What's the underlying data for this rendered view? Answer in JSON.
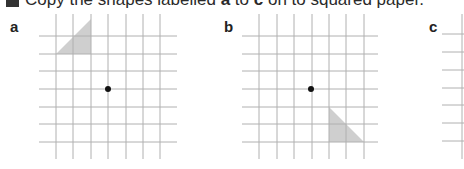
{
  "question": {
    "number_box": "",
    "text_before": "Copy the shapes labelled ",
    "first_label": "a",
    "text_middle": " to ",
    "last_label": "c",
    "text_after": " on to squared paper."
  },
  "figures": [
    {
      "label": "a",
      "grid": {
        "columns_x": [
          56,
          73,
          91,
          108,
          126,
          143,
          160
        ],
        "rows_y": [
          36,
          54,
          71,
          89,
          107,
          124,
          142
        ],
        "vertical_span": [
          14,
          159
        ],
        "horizontal_span": [
          39,
          177
        ]
      },
      "centre_dot": {
        "x": 108,
        "y": 89
      },
      "shape": {
        "type": "right-triangle",
        "points": [
          [
            56,
            54
          ],
          [
            91,
            54
          ],
          [
            91,
            19
          ]
        ]
      }
    },
    {
      "label": "b",
      "grid": {
        "columns_x": [
          259,
          277,
          294,
          312,
          329,
          346,
          364
        ],
        "rows_y": [
          36,
          54,
          71,
          89,
          107,
          124,
          142
        ],
        "vertical_span": [
          14,
          159
        ],
        "horizontal_span": [
          242,
          378
        ]
      },
      "centre_dot": {
        "x": 311,
        "y": 89
      },
      "shape": {
        "type": "right-triangle",
        "points": [
          [
            329,
            107
          ],
          [
            329,
            142
          ],
          [
            364,
            142
          ]
        ]
      }
    },
    {
      "label": "c",
      "grid": {
        "columns_x": [
          462
        ],
        "rows_y": [
          34,
          52,
          70,
          88,
          105,
          123,
          141
        ],
        "vertical_span": [
          14,
          159
        ],
        "horizontal_span": [
          442,
          464
        ]
      }
    }
  ],
  "colors": {
    "grid_line": "#b0b0b0",
    "triangle_fill": "#cfcfcf",
    "dot": "#111111",
    "text": "#2a2a2a"
  }
}
